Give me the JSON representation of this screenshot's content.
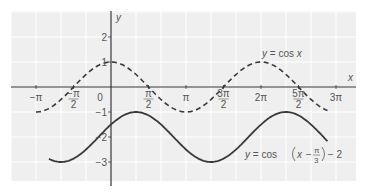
{
  "chart_data": {
    "type": "line",
    "title": "",
    "xlabel": "x",
    "ylabel": "y",
    "xlim_radians": [
      -3.3,
      10.0
    ],
    "ylim": [
      -3.7,
      2.9
    ],
    "grid": true,
    "x_ticks": [
      {
        "value": -3.14159,
        "label": "−π"
      },
      {
        "value": -1.5708,
        "label": "−π/2",
        "num": "−π",
        "den": "2",
        "frac": true
      },
      {
        "value": 0,
        "label": "0"
      },
      {
        "value": 1.5708,
        "label": "π/2",
        "num": "π",
        "den": "2",
        "frac": true
      },
      {
        "value": 3.14159,
        "label": "π"
      },
      {
        "value": 4.7124,
        "label": "3π/2",
        "num": "3π",
        "den": "2",
        "frac": true
      },
      {
        "value": 6.2832,
        "label": "2π"
      },
      {
        "value": 7.854,
        "label": "5π/2",
        "num": "5π",
        "den": "2",
        "frac": true
      },
      {
        "value": 9.4248,
        "label": "3π"
      }
    ],
    "y_ticks": [
      {
        "value": 2,
        "label": "2"
      },
      {
        "value": 1,
        "label": "1"
      },
      {
        "value": -1,
        "label": "−1"
      },
      {
        "value": -2,
        "label": "−2"
      },
      {
        "value": -3,
        "label": "−3"
      }
    ],
    "series": [
      {
        "name": "y = cos x",
        "style": "dashed",
        "x_range": [
          -3.14159,
          9.07
        ],
        "key_points": [
          [
            -3.14159,
            -1
          ],
          [
            0,
            1
          ],
          [
            3.14159,
            -1
          ],
          [
            6.2832,
            1
          ],
          [
            9.07,
            -0.93
          ]
        ]
      },
      {
        "name": "y = cos(x − π/3) − 2",
        "style": "solid",
        "x_range": [
          -2.6,
          9.07
        ],
        "key_points": [
          [
            -2.0944,
            -3
          ],
          [
            1.0472,
            -1
          ],
          [
            4.1888,
            -3
          ],
          [
            7.3304,
            -1
          ],
          [
            9.07,
            -2.8
          ]
        ]
      }
    ],
    "annotations": [
      {
        "text": "y = cos x",
        "near_series": 0
      },
      {
        "text": "y = cos(x − π/3) − 2",
        "near_series": 1
      }
    ]
  },
  "labels": {
    "x_axis": "x",
    "y_axis": "y",
    "cos_label_y": "y",
    "cos_label_rest": " = cos ",
    "cos_label_x": "x",
    "shift_y": "y",
    "shift_eq": " = cos",
    "shift_x": "x",
    "shift_minus": " − ",
    "shift_num": "π",
    "shift_den": "3",
    "shift_tail": " − 2"
  },
  "colors": {
    "curve": "#3a3a3a",
    "axis": "#333333",
    "grid": "#ffffff",
    "background": "#efefef",
    "text": "#555555"
  }
}
